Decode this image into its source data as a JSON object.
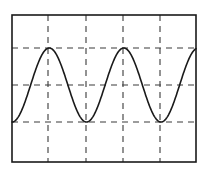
{
  "figure": {
    "name": "oscilloscope-waveform-display"
  },
  "colors": {
    "background": "#ffffff",
    "frame": "#1a1a1a",
    "grid": "#3a3a3a",
    "trace": "#1a1a1a"
  },
  "geometry": {
    "width": 206,
    "height": 173,
    "frame": {
      "x": 12,
      "y": 15,
      "w": 184,
      "h": 147
    },
    "grid_x": [
      48,
      86,
      123,
      160
    ],
    "grid_y": [
      48,
      85,
      122
    ],
    "frame_stroke": 1.6,
    "grid_stroke": 1.1,
    "grid_dash": "6,5",
    "trace_stroke": 1.6
  },
  "chart_data": {
    "type": "line",
    "title": "",
    "xlabel": "",
    "ylabel": "",
    "grid": true,
    "legend": null,
    "xlim": [
      12,
      196
    ],
    "ylim": [
      122,
      48
    ],
    "waveform": {
      "shape": "sine",
      "phase": "starts at minimum (negative cosine)",
      "amplitude_px": 37,
      "midline_y_px": 85,
      "peak_y_px": 48,
      "trough_y_px": 122,
      "period_px": 74.5,
      "cycles_visible": 2.5,
      "start_x_px": 12,
      "end_x_px": 196
    },
    "extrema": [
      {
        "type": "trough",
        "x": 12,
        "y": 122
      },
      {
        "type": "peak",
        "x": 48,
        "y": 48
      },
      {
        "type": "trough",
        "x": 86,
        "y": 122
      },
      {
        "type": "peak",
        "x": 123,
        "y": 48
      },
      {
        "type": "trough",
        "x": 160,
        "y": 122
      },
      {
        "type": "peak",
        "x": 196,
        "y": 48
      }
    ],
    "gridlines": {
      "vertical_x": [
        48,
        86,
        123,
        160
      ],
      "horizontal_y": [
        48,
        85,
        122
      ]
    }
  }
}
